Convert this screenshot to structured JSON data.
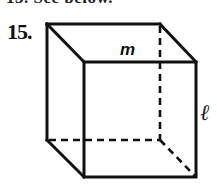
{
  "page": {
    "cropped_previous_line": "13. See below.",
    "problem": {
      "number": "15.",
      "figure": {
        "type": "cube",
        "edge_labels": {
          "top_front_edge": "m",
          "right_front_edge": "ℓ"
        },
        "hidden_edges_style": "dashed"
      }
    }
  }
}
